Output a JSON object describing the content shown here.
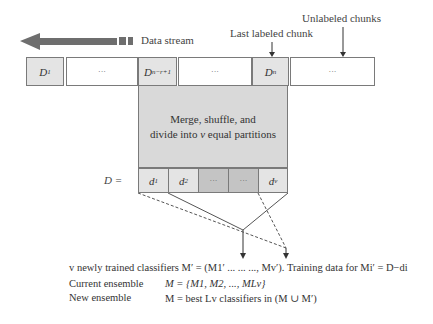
{
  "diagram": {
    "stream_label": "Data stream",
    "last_labeled_label": "Last labeled chunk",
    "unlabeled_label": "Unlabeled chunks",
    "chunks": [
      {
        "id": "D1",
        "base": "D",
        "sub": "1",
        "shade": "light"
      },
      {
        "id": "ellipsis-1",
        "text": "···",
        "shade": "white"
      },
      {
        "id": "Dn-r+1",
        "base": "D",
        "sub": "n−r+1",
        "shade": "light"
      },
      {
        "id": "ellipsis-2",
        "text": "···",
        "shade": "white"
      },
      {
        "id": "Dn",
        "base": "D",
        "sub": "n",
        "shade": "light"
      },
      {
        "id": "ellipsis-unlabeled",
        "text": "···",
        "shade": "white"
      }
    ],
    "process_text_line1": "Merge, shuffle, and",
    "process_text_line2_pre": "divide into ",
    "process_text_line2_var": "v",
    "process_text_line2_post": " equal partitions",
    "partition_label": "D =",
    "partitions": [
      {
        "id": "d1",
        "base": "d",
        "sub": "1",
        "shade": "light"
      },
      {
        "id": "d2",
        "base": "d",
        "sub": "2",
        "shade": "light"
      },
      {
        "id": "ellipsis-p1",
        "text": "···",
        "shade": "dark"
      },
      {
        "id": "ellipsis-p2",
        "text": "···",
        "shade": "dark"
      },
      {
        "id": "dv",
        "base": "d",
        "sub": "v",
        "shade": "light"
      }
    ],
    "captions": {
      "line1": "v newly trained classifiers M′ = (M1′ ... ... ..., Mv′). Training data for Mi′ = D−di",
      "line2_label": "Current ensemble",
      "line2_value": "M = {M1, M2, ..., MLv}",
      "line3_label": "New ensemble",
      "line3_value": "M = best Lv classifiers in (M ∪ M′)"
    }
  }
}
